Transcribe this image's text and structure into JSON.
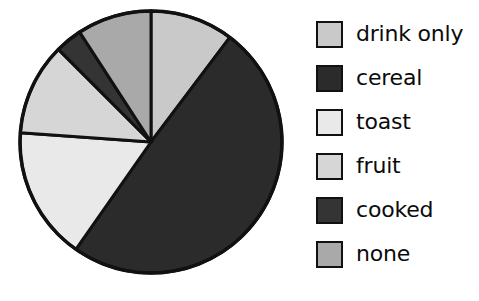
{
  "chart_data": {
    "type": "pie",
    "title": "",
    "subtitle": "",
    "xlabel": "",
    "ylabel": "",
    "grid": false,
    "legend_position": "right",
    "start_angle_deg": 0,
    "direction": "clockwise",
    "categories": [
      "drink only",
      "cereal",
      "toast",
      "fruit",
      "cooked",
      "none"
    ],
    "values": [
      10.3,
      49.4,
      16.4,
      11.4,
      3.3,
      9.2
    ],
    "value_unit": "percent",
    "slice_angles_deg": [
      37,
      178,
      59,
      41,
      12,
      33
    ],
    "colors": [
      "#c9c9c9",
      "#2b2b2b",
      "#e9e9e9",
      "#d6d6d6",
      "#343434",
      "#a9a9a9"
    ],
    "slices": [
      {
        "label": "drink only",
        "value": 10.3,
        "angle_deg": 37,
        "start_deg": 0,
        "end_deg": 37,
        "color": "#c9c9c9"
      },
      {
        "label": "cereal",
        "value": 49.4,
        "angle_deg": 178,
        "start_deg": 37,
        "end_deg": 215,
        "color": "#2b2b2b"
      },
      {
        "label": "toast",
        "value": 16.4,
        "angle_deg": 59,
        "start_deg": 215,
        "end_deg": 274,
        "color": "#e9e9e9"
      },
      {
        "label": "fruit",
        "value": 11.4,
        "angle_deg": 41,
        "start_deg": 274,
        "end_deg": 315,
        "color": "#d6d6d6"
      },
      {
        "label": "cooked",
        "value": 3.3,
        "angle_deg": 12,
        "start_deg": 315,
        "end_deg": 327,
        "color": "#343434"
      },
      {
        "label": "none",
        "value": 9.2,
        "angle_deg": 33,
        "start_deg": 327,
        "end_deg": 360,
        "color": "#a9a9a9"
      }
    ]
  },
  "legend": {
    "items": [
      {
        "label": "drink only",
        "color": "#c9c9c9"
      },
      {
        "label": "cereal",
        "color": "#2b2b2b"
      },
      {
        "label": "toast",
        "color": "#e9e9e9"
      },
      {
        "label": "fruit",
        "color": "#d6d6d6"
      },
      {
        "label": "cooked",
        "color": "#343434"
      },
      {
        "label": "none",
        "color": "#a9a9a9"
      }
    ]
  },
  "style": {
    "outline_color": "#111111",
    "background": "#ffffff",
    "text_color": "#0b0b0b"
  },
  "geometry": {
    "center_x": 151,
    "center_y": 142,
    "radius": 131
  }
}
